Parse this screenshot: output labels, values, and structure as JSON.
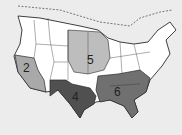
{
  "map": {
    "title": "",
    "background": "#ececec",
    "border_color": "#2a2a2a",
    "regions": [
      {
        "id": "region-2",
        "label": "2",
        "name": "Far West",
        "fill": "#a9a9a9"
      },
      {
        "id": "region-4",
        "label": "4",
        "name": "Southwest",
        "fill": "#505050"
      },
      {
        "id": "region-5",
        "label": "5",
        "name": "Midwest / Plains",
        "fill": "#bdbdbd"
      },
      {
        "id": "region-6",
        "label": "6",
        "name": "Southeast",
        "fill": "#707070"
      },
      {
        "id": "unshaded",
        "label": "",
        "name": "Other states",
        "fill": "#ffffff"
      }
    ]
  }
}
